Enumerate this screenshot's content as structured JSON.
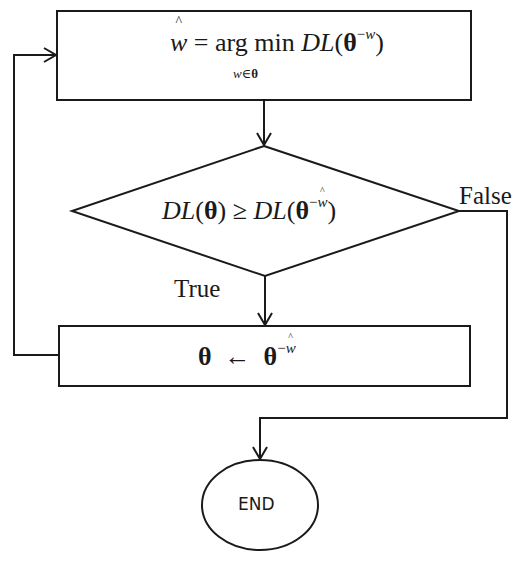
{
  "flowchart": {
    "nodes": {
      "argmin_box": {
        "type": "process",
        "lhs": "w",
        "equals": "=",
        "operator": "arg min",
        "subscript_var": "w",
        "subscript_rel": "∈",
        "subscript_set": "θ",
        "func": "DL",
        "open": "(",
        "theta": "θ",
        "sup_minus": "−",
        "sup_var": "w",
        "close": ")"
      },
      "decision": {
        "type": "decision",
        "func_left": "DL",
        "open_left": "(",
        "theta_left": "θ",
        "close_left": ")",
        "relation": "≥",
        "func_right": "DL",
        "open_right": "(",
        "theta_right": "θ",
        "sup_minus": "−",
        "sup_var": "w",
        "close_right": ")"
      },
      "update_box": {
        "type": "process",
        "lhs": "θ",
        "arrow": "←",
        "rhs": "θ",
        "sup_minus": "−",
        "sup_var": "w"
      },
      "end": {
        "type": "terminator",
        "label": "END"
      }
    },
    "edges": {
      "true_label": "True",
      "false_label": "False"
    },
    "colors": {
      "stroke": "#1a1a1a",
      "background": "#ffffff"
    }
  }
}
